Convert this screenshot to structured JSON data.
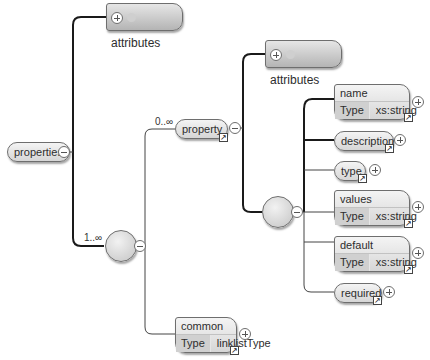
{
  "diagram": {
    "root": {
      "label": "properties"
    },
    "root_attributes": {
      "label": "attributes",
      "expand": "plus",
      "icon": "attribute-dot"
    },
    "sequence_multiplicity": "1..∞",
    "property": {
      "label": "property",
      "multiplicity": "0..∞",
      "has_ref": true
    },
    "property_attributes": {
      "label": "attributes"
    },
    "children": [
      {
        "label": "name",
        "type_key": "Type",
        "type_value": "xs:string"
      },
      {
        "label": "description"
      },
      {
        "label": "type"
      },
      {
        "label": "values",
        "type_key": "Type",
        "type_value": "xs:string"
      },
      {
        "label": "default",
        "type_key": "Type",
        "type_value": "xs:string"
      },
      {
        "label": "required"
      }
    ],
    "common": {
      "label": "common",
      "type_key": "Type",
      "type_value": "linklistType"
    },
    "colors": {
      "line": "#1a1a1a",
      "node_border": "#6e6e6e",
      "node_fill": "#e0e0e0"
    }
  }
}
